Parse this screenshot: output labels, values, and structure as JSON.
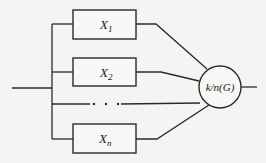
{
  "diagram": {
    "type": "k-out-of-n parallel reliability block diagram",
    "blocks": [
      {
        "label": "X",
        "subscript": "1"
      },
      {
        "label": "X",
        "subscript": "2"
      },
      {
        "label": "X",
        "subscript": "n"
      }
    ],
    "ellipsis": "· · ·",
    "voter": {
      "label": "k/n(G)"
    },
    "colors": {
      "stroke": "#2a2a2a",
      "background": "#f4f4f2"
    }
  }
}
